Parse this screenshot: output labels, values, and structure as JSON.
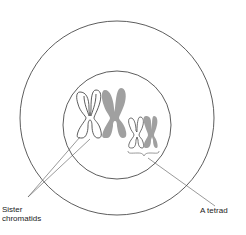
{
  "diagram": {
    "labels": {
      "sister_chromatids_line1": "Sister",
      "sister_chromatids_line2": "chromatids",
      "tetrad": "A tetrad"
    },
    "colors": {
      "outline": "#333333",
      "shaded_chromosome": "#a0a0a0",
      "background": "#ffffff",
      "leader_line": "#555555"
    },
    "shapes": {
      "outer_circle": {
        "cx": 117,
        "cy": 118,
        "r": 97
      },
      "inner_circle": {
        "cx": 117,
        "cy": 125,
        "r": 54
      }
    }
  }
}
